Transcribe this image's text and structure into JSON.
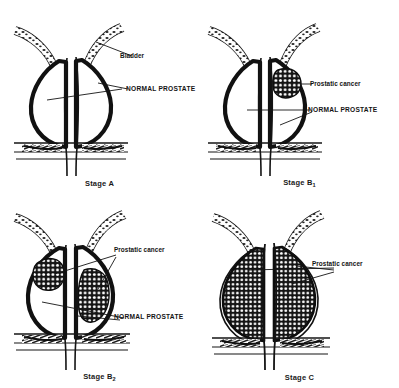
{
  "figure": {
    "background_color": "#ffffff",
    "ink_color": "#111111"
  },
  "panels": [
    {
      "id": "stage-a",
      "stage_label": "Stage A",
      "stage_letter": "Stage A",
      "subscript": "",
      "labels": [
        {
          "name": "bladder",
          "text": "Bladder",
          "style": "regular"
        },
        {
          "name": "normal-prostate",
          "text": "NORMAL PROSTATE",
          "style": "caps"
        }
      ],
      "tumors": 0,
      "description": "Normal prostate with no visible tumor"
    },
    {
      "id": "stage-b1",
      "stage_label": "Stage B1",
      "stage_letter": "Stage B",
      "subscript": "1",
      "labels": [
        {
          "name": "prostatic-cancer",
          "text": "Prostatic cancer",
          "style": "regular"
        },
        {
          "name": "normal-prostate",
          "text": "NORMAL PROSTATE",
          "style": "caps"
        }
      ],
      "tumors": 1,
      "description": "Single small nodule confined to one lobe"
    },
    {
      "id": "stage-b2",
      "stage_label": "Stage B2",
      "stage_letter": "Stage B",
      "subscript": "2",
      "labels": [
        {
          "name": "prostatic-cancer",
          "text": "Prostatic cancer",
          "style": "regular"
        },
        {
          "name": "normal-prostate",
          "text": "NORMAL PROSTATE",
          "style": "caps"
        }
      ],
      "tumors": 2,
      "description": "Nodules in both lobes, prostate still confined"
    },
    {
      "id": "stage-c",
      "stage_label": "Stage C",
      "stage_letter": "Stage C",
      "subscript": "",
      "labels": [
        {
          "name": "prostatic-cancer",
          "text": "Prostatic cancer",
          "style": "regular"
        }
      ],
      "tumors": 2,
      "description": "Tumor fills and extends beyond the prostate capsule"
    }
  ]
}
